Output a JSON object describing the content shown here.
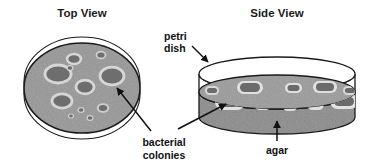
{
  "figure": {
    "panels": [
      {
        "id": "top-view",
        "title": "Top View"
      },
      {
        "id": "side-view",
        "title": "Side View"
      }
    ],
    "labels": [
      {
        "id": "petri-dish",
        "line1": "petri",
        "line2": "dish",
        "text": "petri dish",
        "pointer": "arrow-down-right"
      },
      {
        "id": "bacterial-colonies",
        "line1": "bacterial",
        "line2": "colonies",
        "text": "bacterial colonies",
        "pointer": "two-leader-lines-with-arrows"
      },
      {
        "id": "agar",
        "line1": "agar",
        "text": "agar",
        "pointer": "arrow-up"
      }
    ],
    "colors": {
      "agar_fill": "#969696",
      "colony_fill": "#6e6e6e",
      "colony_halo": "#d2d2d2",
      "agar_side_fill": "#8a8a8a",
      "lid_fill": "#ffffff",
      "outline": "#1a1a1a",
      "text": "#111111",
      "background": "#ffffff"
    },
    "top_view": {
      "dish_outline_count": 2,
      "agar_disc": {
        "cx": 82,
        "cy": 88,
        "rx": 58,
        "ry": 45
      },
      "colonies": [
        {
          "cx": 58,
          "cy": 74,
          "rx": 13,
          "ry": 9
        },
        {
          "cx": 112,
          "cy": 76,
          "rx": 12,
          "ry": 9
        },
        {
          "cx": 85,
          "cy": 86,
          "rx": 9,
          "ry": 7
        },
        {
          "cx": 62,
          "cy": 101,
          "rx": 10,
          "ry": 7
        },
        {
          "cx": 74,
          "cy": 59,
          "rx": 7,
          "ry": 5
        },
        {
          "cx": 100,
          "cy": 55,
          "rx": 4.5,
          "ry": 3.5
        },
        {
          "cx": 103,
          "cy": 108,
          "rx": 5,
          "ry": 4
        },
        {
          "cx": 70,
          "cy": 68,
          "rx": 3,
          "ry": 2.5
        },
        {
          "cx": 81,
          "cy": 110,
          "rx": 3,
          "ry": 2.5
        },
        {
          "cx": 90,
          "cy": 118,
          "rx": 3,
          "ry": 2.5
        },
        {
          "cx": 71,
          "cy": 116,
          "rx": 2.5,
          "ry": 2
        }
      ],
      "colony_count_visible": 11
    },
    "side_view": {
      "lid_rim": {
        "cx": 277,
        "cy": 74,
        "rx": 78,
        "ry": 17
      },
      "agar_slab": {
        "cx": 277,
        "cy": 92,
        "rx": 78,
        "ry": 17,
        "thickness": 25
      },
      "colonies_on_surface": 9,
      "colonies_on_front_band": 5
    }
  }
}
